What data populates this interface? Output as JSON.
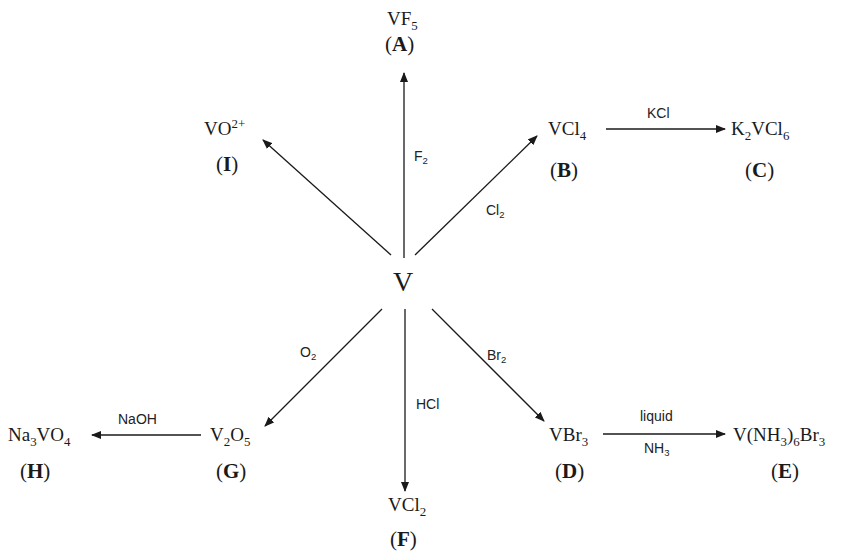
{
  "center": {
    "formula": "V"
  },
  "nodes": [
    {
      "id": "A",
      "formula": "VF5",
      "label": "(A)"
    },
    {
      "id": "B",
      "formula": "VCl4",
      "label": "(B)"
    },
    {
      "id": "C",
      "formula": "K2VCl6",
      "label": "(C)"
    },
    {
      "id": "D",
      "formula": "VBr3",
      "label": "(D)"
    },
    {
      "id": "E",
      "formula": "V(NH3)6Br3",
      "label": "(E)"
    },
    {
      "id": "F",
      "formula": "VCl2",
      "label": "(F)"
    },
    {
      "id": "G",
      "formula": "V2O5",
      "label": "(G)"
    },
    {
      "id": "H",
      "formula": "Na3VO4",
      "label": "(H)"
    },
    {
      "id": "I",
      "formula": "VO2+",
      "label": "(I)"
    }
  ],
  "reagents": {
    "to_A": "F2",
    "to_B": "Cl2",
    "B_to_C": "KCl",
    "to_D": "Br2",
    "D_to_E_top": "liquid",
    "D_to_E_bottom": "NH3",
    "to_F": "HCl",
    "to_G": "O2",
    "G_to_H": "NaOH"
  },
  "ids": {
    "A": "A",
    "B": "B",
    "C": "C",
    "D": "D",
    "E": "E",
    "F": "F",
    "G": "G",
    "H": "H",
    "I": "I"
  },
  "colors": {
    "line": "#1a1a1a",
    "text": "#1a1a1a"
  }
}
